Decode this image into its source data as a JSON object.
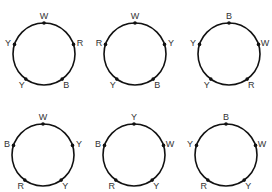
{
  "diagram": {
    "circles": [
      {
        "id": 1,
        "cx": 44,
        "cy": 54,
        "r": 31,
        "beads": [
          {
            "label": "W",
            "angle": 90
          },
          {
            "label": "R",
            "angle": 18
          },
          {
            "label": "B",
            "angle": -54
          },
          {
            "label": "Y",
            "angle": -126
          },
          {
            "label": "Y",
            "angle": 162
          }
        ]
      },
      {
        "id": 2,
        "cx": 135,
        "cy": 54,
        "r": 31,
        "beads": [
          {
            "label": "W",
            "angle": 90
          },
          {
            "label": "Y",
            "angle": 18
          },
          {
            "label": "B",
            "angle": -54
          },
          {
            "label": "Y",
            "angle": -126
          },
          {
            "label": "R",
            "angle": 162
          }
        ]
      },
      {
        "id": 3,
        "cx": 229,
        "cy": 54,
        "r": 31,
        "beads": [
          {
            "label": "B",
            "angle": 90
          },
          {
            "label": "W",
            "angle": 18
          },
          {
            "label": "R",
            "angle": -54
          },
          {
            "label": "Y",
            "angle": -126
          },
          {
            "label": "Y",
            "angle": 162
          }
        ]
      },
      {
        "id": 4,
        "cx": 43,
        "cy": 155,
        "r": 31,
        "beads": [
          {
            "label": "W",
            "angle": 90
          },
          {
            "label": "Y",
            "angle": 18
          },
          {
            "label": "Y",
            "angle": -54
          },
          {
            "label": "R",
            "angle": -126
          },
          {
            "label": "B",
            "angle": 162
          }
        ]
      },
      {
        "id": 5,
        "cx": 134,
        "cy": 155,
        "r": 31,
        "beads": [
          {
            "label": "Y",
            "angle": 90
          },
          {
            "label": "W",
            "angle": 18
          },
          {
            "label": "Y",
            "angle": -54
          },
          {
            "label": "R",
            "angle": -126
          },
          {
            "label": "B",
            "angle": 162
          }
        ]
      },
      {
        "id": 6,
        "cx": 226,
        "cy": 155,
        "r": 31,
        "beads": [
          {
            "label": "B",
            "angle": 90
          },
          {
            "label": "W",
            "angle": 18
          },
          {
            "label": "Y",
            "angle": -54
          },
          {
            "label": "R",
            "angle": -126
          },
          {
            "label": "Y",
            "angle": 162
          }
        ]
      }
    ]
  }
}
